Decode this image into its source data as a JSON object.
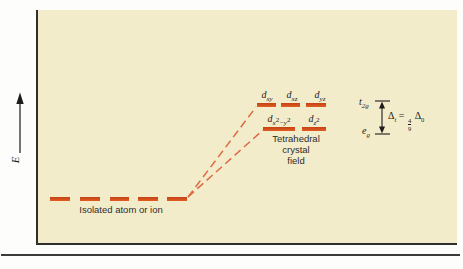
{
  "figure": {
    "energy_axis_label": "E",
    "isolated_level_label": "Isolated atom or ion",
    "field_label_line1": "Tetrahedral",
    "field_label_line2": "crystal",
    "field_label_line3": "field"
  },
  "orbitals": {
    "d": "d",
    "xy": "xy",
    "xz": "xz",
    "yz": "yz",
    "x": "x",
    "y_with_minus": "−y",
    "z": "z",
    "two": "2"
  },
  "annotation": {
    "t2_base": "t",
    "t2_sub": "2g",
    "e_base": "e",
    "e_sub": "g",
    "delta": "Δ",
    "delta_t_sub": "t",
    "equals": "=",
    "fraction_numerator": "4",
    "fraction_denominator": "9",
    "delta_o_sub": "0"
  },
  "colors": {
    "plot_background": "#f3ecca",
    "level_bar": "#d8521f",
    "connector_dash": "#dd6a42",
    "axis": "#2f2f2f",
    "text": "#1f1f1f"
  }
}
